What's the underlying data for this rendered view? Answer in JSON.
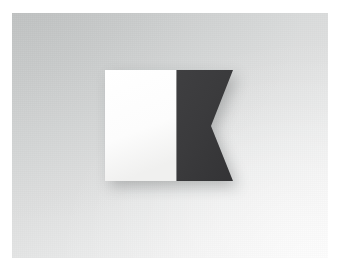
{
  "photo": {
    "subject": "International maritime signal flag Alpha (A) — Diver down, keep clear",
    "alt_text": "Photograph of a two-tone swallowtail signal flag: white vertical band on the hoist and a dark navy-blue swallowtail on the fly, set against a pale gray studio backdrop.",
    "orientation": "landscape",
    "border_label": "white photographic border"
  },
  "flag": {
    "name": "Alpha",
    "letter": "A",
    "shape": "swallowtail",
    "hoist_panel_label": "white hoist panel",
    "fly_panel_label": "blue swallowtail fly panel",
    "notch_label": "swallowtail notch"
  },
  "colors": {
    "white_panel": "#fdfdfd",
    "white_panel_shade": "#f0f0ef",
    "blue_panel": "#3b3b3d",
    "blue_panel_shade": "#343436",
    "blue_panel_highlight": "#434345",
    "backdrop_dark": "#cdcfcf",
    "backdrop_light": "#f6f6f6",
    "shadow": "#6e7172",
    "frame": "#ffffff"
  },
  "geometry": {
    "canvas_x": 12,
    "canvas_y": 13,
    "canvas_width": 316,
    "canvas_height": 245,
    "flag_left": 105,
    "flag_top": 70,
    "flag_bottom": 181,
    "white_right": 176,
    "fly_tip_right": 233,
    "notch_x": 211,
    "notch_y": 126
  }
}
